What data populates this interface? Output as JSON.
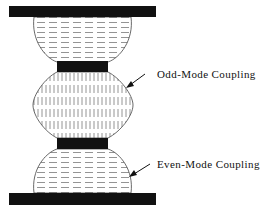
{
  "diagram": {
    "labels": {
      "odd": "Odd-Mode Coupling",
      "even": "Even-Mode Coupling"
    },
    "colors": {
      "conductor": "#111111",
      "field_line": "#888888",
      "outline": "#444444",
      "background": "#ffffff"
    }
  }
}
